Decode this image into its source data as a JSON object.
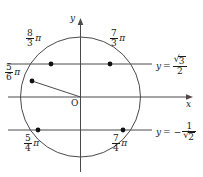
{
  "figure": {
    "background_color": "#ffffff",
    "stroke_color": "#4a4a4a",
    "text_color": "#1b1b1b",
    "point_color": "#111111"
  },
  "axes": {
    "x_label": "x",
    "y_label": "y",
    "origin_label": "O",
    "origin_px": {
      "x": 80.5,
      "y": 97
    },
    "x_axis_y_px": 97,
    "y_axis_x_px": 80.5
  },
  "circle": {
    "center_px": {
      "x": 80.5,
      "y": 97
    },
    "radius_px": 60
  },
  "reference_lines": [
    {
      "id": "line-upper",
      "y_px": 64,
      "x_start_px": 8,
      "x_end_px": 152,
      "equation": {
        "lhs": "y",
        "eq": "=",
        "negative": false,
        "numerator": "3",
        "numerator_has_radical": true,
        "denominator": "2",
        "denominator_has_radical": false,
        "text": "y = √3/2"
      }
    },
    {
      "id": "line-lower",
      "y_px": 130,
      "x_start_px": 8,
      "x_end_px": 152,
      "equation": {
        "lhs": "y",
        "eq": "=",
        "negative": true,
        "numerator": "1",
        "numerator_has_radical": false,
        "denominator": "2",
        "denominator_has_radical": true,
        "text": "y = -1/√2"
      }
    }
  ],
  "radius_segment": {
    "from_px": {
      "x": 80.5,
      "y": 97
    },
    "to_px": {
      "x": 32,
      "y": 81
    }
  },
  "points": [
    {
      "id": "point-8-3-pi",
      "numerator": "8",
      "denominator": "3",
      "symbol": "π",
      "text": "8/3 π",
      "px": {
        "x": 51,
        "y": 64
      },
      "label_px": {
        "x": 28,
        "y": 36
      }
    },
    {
      "id": "point-7-3-pi",
      "numerator": "7",
      "denominator": "3",
      "symbol": "π",
      "text": "7/3 π",
      "px": {
        "x": 110,
        "y": 64
      },
      "label_px": {
        "x": 112,
        "y": 36
      }
    },
    {
      "id": "point-5-6-pi",
      "numerator": "5",
      "denominator": "6",
      "symbol": "π",
      "text": "5/6 π",
      "px": {
        "x": 32,
        "y": 81
      },
      "label_px": {
        "x": 6,
        "y": 70
      }
    },
    {
      "id": "point-5-4-pi",
      "numerator": "5",
      "denominator": "4",
      "symbol": "π",
      "text": "5/4 π",
      "px": {
        "x": 38,
        "y": 130
      },
      "label_px": {
        "x": 25,
        "y": 136
      }
    },
    {
      "id": "point-7-4-pi",
      "numerator": "7",
      "denominator": "4",
      "symbol": "π",
      "text": "7/4 π",
      "px": {
        "x": 123,
        "y": 130
      },
      "label_px": {
        "x": 113,
        "y": 136
      }
    }
  ],
  "glyphs": {
    "radical": "√",
    "minus": "−",
    "equals": "="
  }
}
